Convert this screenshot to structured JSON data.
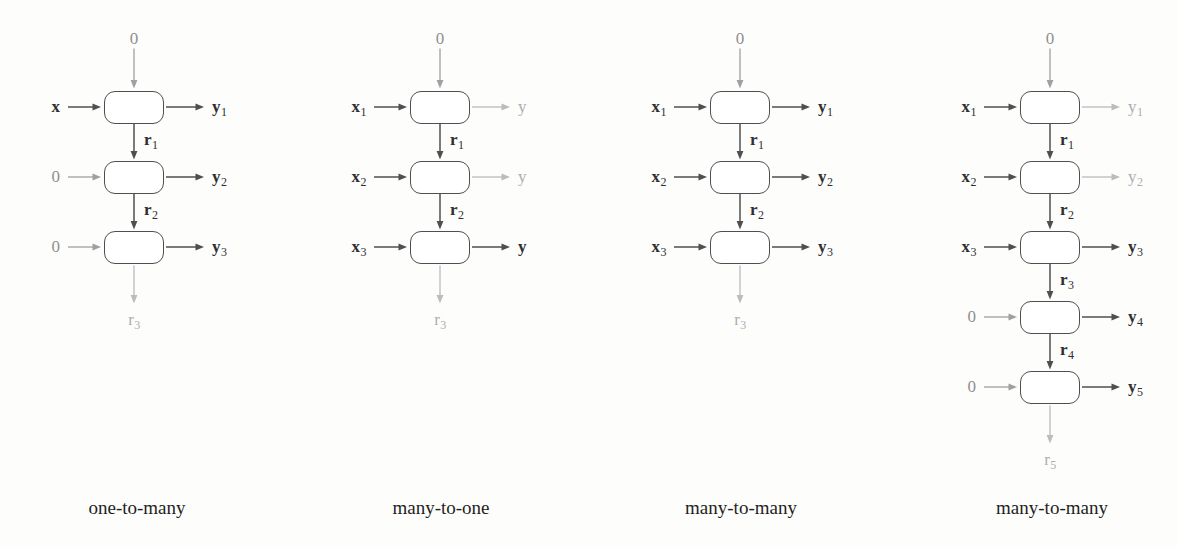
{
  "figure": {
    "background_color": "#fdfdfc",
    "dark_color": "#2f2f33",
    "mid_color": "#8f8f93",
    "dim_color": "#adadb0",
    "box_border_color": "#4f4f52"
  },
  "panels": [
    {
      "id": "one-to-many",
      "caption": "one-to-many",
      "center_x": 134,
      "caption_center_x": 137,
      "top_input": "0",
      "top_input_tone": "mid",
      "bottom_output": "r",
      "bottom_output_sub": "3",
      "bottom_output_tone": "dim",
      "cells": [
        {
          "input": "x",
          "input_sub": "",
          "input_tone": "bold",
          "output": "y",
          "output_sub": "1",
          "output_tone": "bold",
          "recur": "r",
          "recur_sub": "1",
          "recur_tone": "bold"
        },
        {
          "input": "0",
          "input_sub": "",
          "input_tone": "mid",
          "output": "y",
          "output_sub": "2",
          "output_tone": "bold",
          "recur": "r",
          "recur_sub": "2",
          "recur_tone": "bold"
        },
        {
          "input": "0",
          "input_sub": "",
          "input_tone": "mid",
          "output": "y",
          "output_sub": "3",
          "output_tone": "bold",
          "recur": "",
          "recur_sub": "",
          "recur_tone": "bold"
        }
      ]
    },
    {
      "id": "many-to-one",
      "caption": "many-to-one",
      "center_x": 440,
      "caption_center_x": 441,
      "top_input": "0",
      "top_input_tone": "mid",
      "bottom_output": "r",
      "bottom_output_sub": "3",
      "bottom_output_tone": "dim",
      "cells": [
        {
          "input": "x",
          "input_sub": "1",
          "input_tone": "bold",
          "output": "y",
          "output_sub": "",
          "output_tone": "dim",
          "recur": "r",
          "recur_sub": "1",
          "recur_tone": "bold"
        },
        {
          "input": "x",
          "input_sub": "2",
          "input_tone": "bold",
          "output": "y",
          "output_sub": "",
          "output_tone": "dim",
          "recur": "r",
          "recur_sub": "2",
          "recur_tone": "bold"
        },
        {
          "input": "x",
          "input_sub": "3",
          "input_tone": "bold",
          "output": "y",
          "output_sub": "",
          "output_tone": "bold",
          "recur": "",
          "recur_sub": "",
          "recur_tone": "bold"
        }
      ]
    },
    {
      "id": "many-to-many-a",
      "caption": "many-to-many",
      "center_x": 740,
      "caption_center_x": 741,
      "top_input": "0",
      "top_input_tone": "mid",
      "bottom_output": "r",
      "bottom_output_sub": "3",
      "bottom_output_tone": "dim",
      "cells": [
        {
          "input": "x",
          "input_sub": "1",
          "input_tone": "bold",
          "output": "y",
          "output_sub": "1",
          "output_tone": "bold",
          "recur": "r",
          "recur_sub": "1",
          "recur_tone": "bold"
        },
        {
          "input": "x",
          "input_sub": "2",
          "input_tone": "bold",
          "output": "y",
          "output_sub": "2",
          "output_tone": "bold",
          "recur": "r",
          "recur_sub": "2",
          "recur_tone": "bold"
        },
        {
          "input": "x",
          "input_sub": "3",
          "input_tone": "bold",
          "output": "y",
          "output_sub": "3",
          "output_tone": "bold",
          "recur": "",
          "recur_sub": "",
          "recur_tone": "bold"
        }
      ]
    },
    {
      "id": "many-to-many-b",
      "caption": "many-to-many",
      "center_x": 1050,
      "caption_center_x": 1052,
      "top_input": "0",
      "top_input_tone": "mid",
      "bottom_output": "r",
      "bottom_output_sub": "5",
      "bottom_output_tone": "dim",
      "cells": [
        {
          "input": "x",
          "input_sub": "1",
          "input_tone": "bold",
          "output": "y",
          "output_sub": "1",
          "output_tone": "dim",
          "recur": "r",
          "recur_sub": "1",
          "recur_tone": "bold"
        },
        {
          "input": "x",
          "input_sub": "2",
          "input_tone": "bold",
          "output": "y",
          "output_sub": "2",
          "output_tone": "dim",
          "recur": "r",
          "recur_sub": "2",
          "recur_tone": "bold"
        },
        {
          "input": "x",
          "input_sub": "3",
          "input_tone": "bold",
          "output": "y",
          "output_sub": "3",
          "output_tone": "bold",
          "recur": "r",
          "recur_sub": "3",
          "recur_tone": "bold"
        },
        {
          "input": "0",
          "input_sub": "",
          "input_tone": "mid",
          "output": "y",
          "output_sub": "4",
          "output_tone": "bold",
          "recur": "r",
          "recur_sub": "4",
          "recur_tone": "bold"
        },
        {
          "input": "0",
          "input_sub": "",
          "input_tone": "mid",
          "output": "y",
          "output_sub": "5",
          "output_tone": "bold",
          "recur": "",
          "recur_sub": "",
          "recur_tone": "bold"
        }
      ]
    }
  ],
  "geometry": {
    "first_row_center_y": 107,
    "row_spacing": 70,
    "box_width": 60,
    "box_height": 33,
    "caption_y": 498
  }
}
